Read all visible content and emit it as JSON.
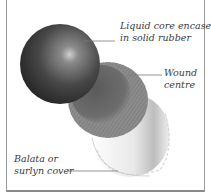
{
  "diagram": {
    "colors": {
      "core": "#3c3c3c",
      "wound": "#7a7a7a",
      "cover": "#f2f2f2",
      "frame": "#9a9a9a",
      "text": "#3a3a3a"
    },
    "labels": [
      {
        "id": "core",
        "line1": "Liquid core encased",
        "line2": "in solid rubber"
      },
      {
        "id": "wound",
        "line1": "Wound",
        "line2": "centre"
      },
      {
        "id": "cover",
        "line1": "Balata or",
        "line2": "surlyn cover"
      }
    ]
  }
}
